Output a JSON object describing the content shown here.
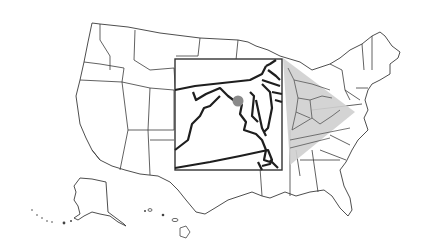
{
  "map": {
    "type": "locator-map",
    "region": "United States",
    "inset": {
      "area": "Virginia / Maryland / District of Columbia",
      "marker": {
        "shape": "dot",
        "color": "#8a8a8a"
      }
    },
    "colors": {
      "background": "#ffffff",
      "state_stroke": "#3a3a3a",
      "inset_stroke": "#1e1e1e",
      "highlight_fill": "#cfcfcf",
      "marker": "#8a8a8a"
    }
  }
}
